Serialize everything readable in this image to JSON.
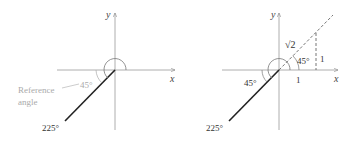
{
  "left_diagram": {
    "axis_x_label": "x",
    "axis_y_label": "y",
    "terminal_angle_label": "225°",
    "reference_angle_value": "45°",
    "reference_angle_caption_line1": "Reference",
    "reference_angle_caption_line2": "angle",
    "caption_color": "#aaaaaa"
  },
  "right_diagram": {
    "axis_x_label": "x",
    "axis_y_label": "y",
    "terminal_angle_label": "225°",
    "reference_angle_value": "45°",
    "triangle_angle_label": "45°",
    "hypotenuse_label": "√2",
    "base_label": "1",
    "height_label": "1"
  }
}
